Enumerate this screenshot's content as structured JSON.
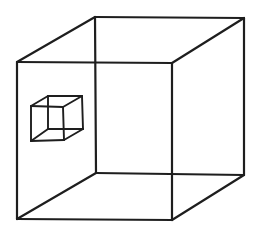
{
  "canvas": {
    "width": 260,
    "height": 234,
    "background": "#ffffff"
  },
  "style": {
    "stroke": "#1e1e1e",
    "large_stroke_width": 2.2,
    "small_stroke_width": 1.9
  },
  "figure": {
    "large_cube": {
      "vertices": {
        "front_top_left": [
          17,
          62
        ],
        "front_top_right": [
          172,
          63
        ],
        "front_bottom_left": [
          17,
          219
        ],
        "front_bottom_right": [
          172,
          220
        ],
        "back_top_left": [
          95,
          17
        ],
        "back_top_right": [
          244,
          18
        ],
        "back_bottom_left": [
          96,
          173
        ],
        "back_bottom_right": [
          244,
          175
        ]
      }
    },
    "small_cube": {
      "vertices": {
        "front_top_left": [
          31,
          106
        ],
        "front_top_right": [
          63,
          107
        ],
        "front_bottom_left": [
          31,
          141
        ],
        "front_bottom_right": [
          64,
          140
        ],
        "back_top_left": [
          48,
          96
        ],
        "back_top_right": [
          82,
          96
        ],
        "back_bottom_left": [
          48,
          129
        ],
        "back_bottom_right": [
          83,
          129
        ]
      }
    },
    "edges": [
      [
        "front_top_left",
        "front_top_right"
      ],
      [
        "front_top_right",
        "front_bottom_right"
      ],
      [
        "front_bottom_right",
        "front_bottom_left"
      ],
      [
        "front_bottom_left",
        "front_top_left"
      ],
      [
        "back_top_left",
        "back_top_right"
      ],
      [
        "back_top_right",
        "back_bottom_right"
      ],
      [
        "back_bottom_right",
        "back_bottom_left"
      ],
      [
        "back_bottom_left",
        "back_top_left"
      ],
      [
        "front_top_left",
        "back_top_left"
      ],
      [
        "front_top_right",
        "back_top_right"
      ],
      [
        "front_bottom_right",
        "back_bottom_right"
      ],
      [
        "front_bottom_left",
        "back_bottom_left"
      ]
    ]
  }
}
